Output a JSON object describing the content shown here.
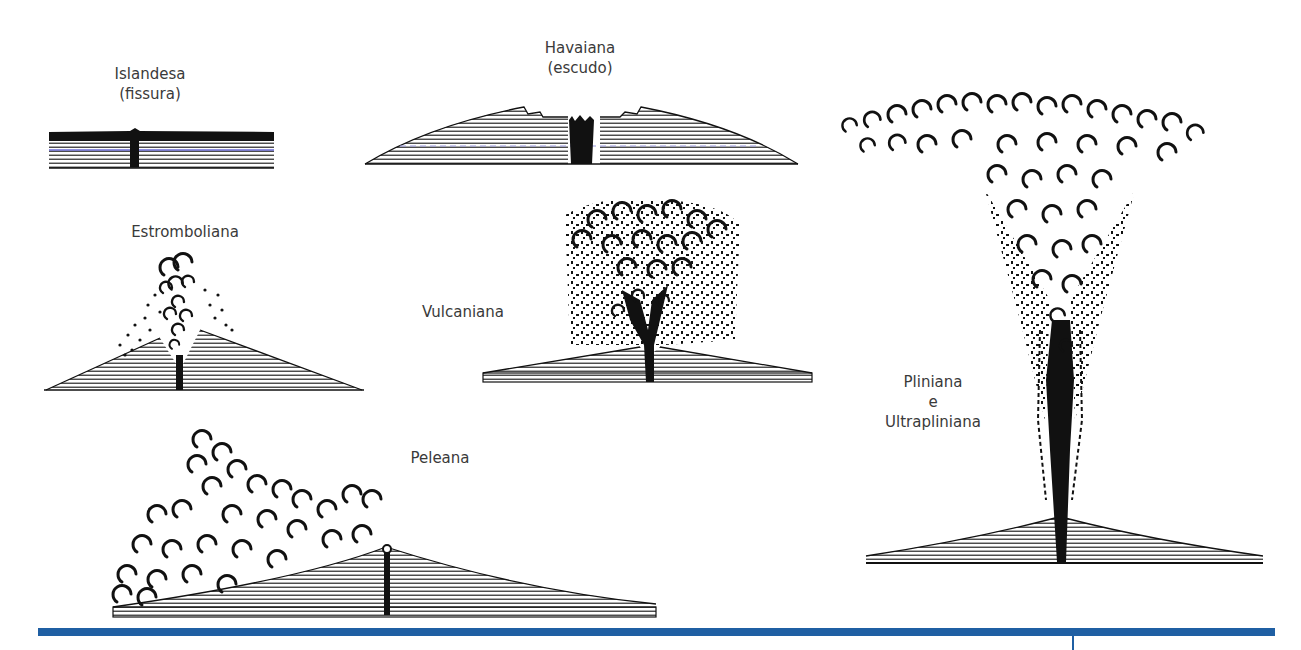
{
  "eruption_types": [
    {
      "id": "islandesa",
      "name": "Islandesa",
      "subtitle": "(fissura)"
    },
    {
      "id": "havaiana",
      "name": "Havaiana",
      "subtitle": "(escudo)"
    },
    {
      "id": "estromboliana",
      "name": "Estromboliana",
      "subtitle": ""
    },
    {
      "id": "vulcaniana",
      "name": "Vulcaniana",
      "subtitle": ""
    },
    {
      "id": "peleana",
      "name": "Peleana",
      "subtitle": ""
    },
    {
      "id": "pliniana",
      "name": "Pliniana",
      "connector": "e",
      "subtitle": "Ultrapliniana"
    }
  ],
  "colors": {
    "ink": "#111111",
    "label": "#3a3a3a",
    "rule": "#1f5fa3",
    "background": "#ffffff"
  }
}
